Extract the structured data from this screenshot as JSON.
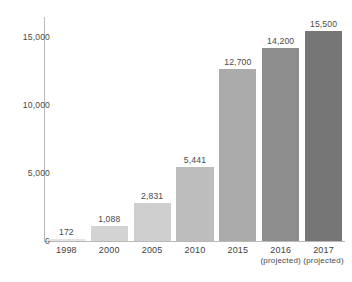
{
  "chart_data": {
    "type": "bar",
    "title": "",
    "subtitle": "",
    "xlabel": "",
    "ylabel": "",
    "categories": [
      "1998",
      "2000",
      "2005",
      "2010",
      "2015",
      "2016",
      "2017"
    ],
    "category_sublabels": [
      "",
      "",
      "",
      "",
      "",
      "(projected)",
      "(projected)"
    ],
    "values": [
      172,
      1088,
      2831,
      5441,
      12700,
      14200,
      15500
    ],
    "value_labels": [
      "172",
      "1,088",
      "2,831",
      "5,441",
      "12,700",
      "14,200",
      "15,500"
    ],
    "bar_colors": [
      "#e3e3e3",
      "#d3d3d3",
      "#cfcfcf",
      "#bdbdbd",
      "#ababab",
      "#8d8d8d",
      "#767676"
    ],
    "ylim": [
      0,
      16500
    ],
    "yticks": [
      0,
      5000,
      10000,
      15000
    ],
    "ytick_labels": [
      "0",
      "5,000",
      "10,000",
      "15,000"
    ],
    "grid": false,
    "legend": null,
    "axis_color": "#b9b9b9"
  }
}
